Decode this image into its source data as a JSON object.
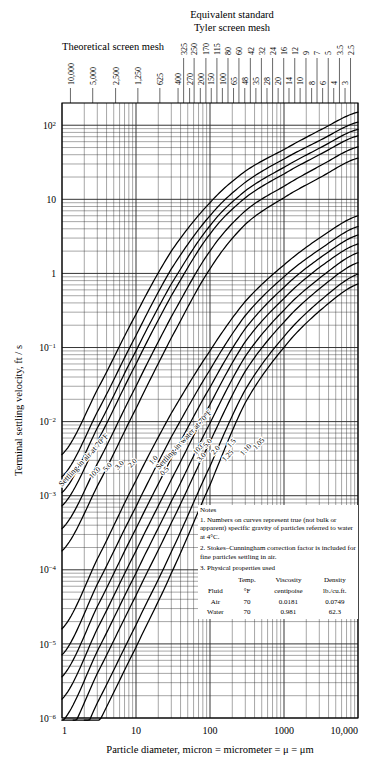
{
  "header": {
    "title_line1": "Equivalent standard",
    "title_line2": "Tyler screen mesh",
    "theoretical_label": "Theoretical screen mesh"
  },
  "axes": {
    "xlabel": "Particle diameter, micron = micrometer = μ = μm",
    "ylabel": "Terminal settling velocity, ft / s",
    "xticks": [
      "1",
      "10",
      "100",
      "1000",
      "10,000"
    ],
    "xtick_values": [
      1,
      10,
      100,
      1000,
      10000
    ],
    "yticks": [
      "10⁻⁶",
      "10⁻⁵",
      "10⁻⁴",
      "10⁻³",
      "10⁻²",
      "10⁻¹",
      "1",
      "10",
      "10²"
    ],
    "ytick_values": [
      -6,
      -5,
      -4,
      -3,
      -2,
      -1,
      0,
      1,
      2
    ],
    "xlim": [
      1,
      10000
    ],
    "ylim": [
      -6,
      2.3
    ]
  },
  "theoretical_mesh": {
    "labels": [
      "10,000",
      "5,000",
      "2,500",
      "1,250",
      "625",
      "400",
      "270",
      "200",
      "150",
      "100",
      "65",
      "48",
      "35",
      "28",
      "20",
      "14",
      "10",
      "8",
      "6",
      "4",
      "3"
    ],
    "microns": [
      1.3,
      2.6,
      5.3,
      10.6,
      21,
      37,
      53,
      74,
      104,
      147,
      208,
      295,
      417,
      589,
      833,
      1168,
      1651,
      2362,
      3327,
      4699,
      6680
    ]
  },
  "tyler_mesh": {
    "labels": [
      "325",
      "250",
      "170",
      "115",
      "80",
      "60",
      "42",
      "32",
      "24",
      "16",
      "12",
      "9",
      "7",
      "5",
      "3.5",
      "2.5"
    ],
    "microns": [
      44,
      61,
      88,
      124,
      175,
      246,
      351,
      495,
      701,
      991,
      1397,
      1981,
      2794,
      3962,
      5613,
      7925
    ]
  },
  "curve_groups": [
    {
      "name": "air",
      "annotation": "Settling in air at 70°F",
      "labels": [
        "10.0",
        "5.0",
        "3.0",
        "2.0",
        "1.0",
        "0.5"
      ],
      "sg": [
        10.0,
        5.0,
        3.0,
        2.0,
        1.0,
        0.5
      ]
    },
    {
      "name": "water",
      "annotation": "Settling in water at 70°F",
      "labels": [
        "10.0",
        "5.0",
        "3.0",
        "2.0",
        "1.5",
        "1.25",
        "1.10",
        "1.05"
      ],
      "sg": [
        10.0,
        5.0,
        3.0,
        2.0,
        1.5,
        1.25,
        1.1,
        1.05
      ]
    }
  ],
  "notes": {
    "heading": "Notes",
    "items": [
      "1.  Numbers on curves represent true (not bulk or apparent) specific gravity of particles referred to water at 4°C.",
      "2.  Stokes–Cunningham correction factor is included for fine particles settling in air.",
      "3.  Physical properties used"
    ],
    "table": {
      "headers": [
        "Fluid",
        "Temp. °F",
        "Viscosity centipoise",
        "Density lb./cu.ft."
      ],
      "header_top": [
        "",
        "Temp.",
        "Viscosity",
        "Density"
      ],
      "header_bottom": [
        "Fluid",
        "°F",
        "centipoise",
        "lb./cu.ft."
      ],
      "rows": [
        [
          "Air",
          "70",
          "0.0181",
          "0.0749"
        ],
        [
          "Water",
          "70",
          "0.981",
          "62.3"
        ]
      ]
    }
  },
  "caption": "",
  "chart_data": {
    "type": "line",
    "xlabel": "Particle diameter, micron = micrometer = μ = μm",
    "ylabel": "Terminal settling velocity, ft / s",
    "xlim": [
      1,
      10000
    ],
    "ylim": [
      1e-06,
      200
    ],
    "xscale": "log",
    "yscale": "log",
    "grid": true,
    "legend": "none (curves labeled inline)",
    "series": [
      {
        "name": "air sg 10.0",
        "group": "air",
        "sg": 10.0,
        "x": [
          1,
          3,
          10,
          30,
          100,
          300,
          1000,
          3000,
          10000
        ],
        "y": [
          0.0036,
          0.027,
          0.28,
          2.0,
          9.0,
          24.0,
          47.0,
          85.0,
          150.0
        ]
      },
      {
        "name": "air sg 5.0",
        "group": "air",
        "sg": 5.0,
        "x": [
          1,
          3,
          10,
          30,
          100,
          300,
          1000,
          3000,
          10000
        ],
        "y": [
          0.0018,
          0.0135,
          0.145,
          1.15,
          6.0,
          17.0,
          35.0,
          62.0,
          110.0
        ]
      },
      {
        "name": "air sg 3.0",
        "group": "air",
        "sg": 3.0,
        "x": [
          1,
          3,
          10,
          30,
          100,
          300,
          1000,
          3000,
          10000
        ],
        "y": [
          0.0011,
          0.0082,
          0.09,
          0.72,
          4.4,
          13.0,
          27.0,
          49.0,
          88.0
        ]
      },
      {
        "name": "air sg 2.0",
        "group": "air",
        "sg": 2.0,
        "x": [
          1,
          3,
          10,
          30,
          100,
          300,
          1000,
          3000,
          10000
        ],
        "y": [
          0.00073,
          0.0054,
          0.06,
          0.5,
          3.4,
          10.5,
          22.0,
          40.0,
          72.0
        ]
      },
      {
        "name": "air sg 1.0",
        "group": "air",
        "sg": 1.0,
        "x": [
          1,
          3,
          10,
          30,
          100,
          300,
          1000,
          3000,
          10000
        ],
        "y": [
          0.00036,
          0.0027,
          0.03,
          0.26,
          2.0,
          7.0,
          15.0,
          28.0,
          51.0
        ]
      },
      {
        "name": "air sg 0.5",
        "group": "air",
        "sg": 0.5,
        "x": [
          1,
          3,
          10,
          30,
          100,
          300,
          1000,
          3000,
          10000
        ],
        "y": [
          0.00018,
          0.00135,
          0.015,
          0.135,
          1.15,
          4.6,
          10.5,
          19.5,
          36.0
        ]
      },
      {
        "name": "water sg 10.0",
        "group": "water",
        "sg": 10.0,
        "x": [
          1,
          3,
          10,
          30,
          100,
          300,
          1000,
          3000,
          10000
        ],
        "y": [
          1.6e-05,
          0.00014,
          0.0016,
          0.013,
          0.09,
          0.42,
          1.3,
          3.0,
          6.0
        ]
      },
      {
        "name": "water sg 5.0",
        "group": "water",
        "sg": 5.0,
        "x": [
          1,
          3,
          10,
          30,
          100,
          300,
          1000,
          3000,
          10000
        ],
        "y": [
          7.1e-06,
          6.4e-05,
          0.00071,
          0.0062,
          0.05,
          0.27,
          0.9,
          2.1,
          4.3
        ]
      },
      {
        "name": "water sg 3.0",
        "group": "water",
        "sg": 3.0,
        "x": [
          1,
          3,
          10,
          30,
          100,
          300,
          1000,
          3000,
          10000
        ],
        "y": [
          3.6e-06,
          3.2e-05,
          0.00036,
          0.0032,
          0.029,
          0.18,
          0.65,
          1.6,
          3.3
        ]
      },
      {
        "name": "water sg 2.0",
        "group": "water",
        "sg": 2.0,
        "x": [
          1,
          3,
          10,
          30,
          100,
          300,
          1000,
          3000,
          10000
        ],
        "y": [
          1.8e-06,
          1.6e-05,
          0.00018,
          0.00165,
          0.017,
          0.12,
          0.46,
          1.2,
          2.5
        ]
      },
      {
        "name": "water sg 1.5",
        "group": "water",
        "sg": 1.5,
        "x": [
          1,
          3,
          10,
          30,
          100,
          300,
          1000,
          3000,
          10000
        ],
        "y": [
          8.9e-07,
          8e-06,
          9e-05,
          0.00084,
          0.0095,
          0.076,
          0.32,
          0.86,
          1.9
        ]
      },
      {
        "name": "water sg 1.25",
        "group": "water",
        "sg": 1.25,
        "x": [
          1,
          3,
          10,
          30,
          100,
          300,
          1000,
          3000,
          10000
        ],
        "y": [
          4.5e-07,
          4e-06,
          4.5e-05,
          0.00043,
          0.0053,
          0.048,
          0.22,
          0.62,
          1.4
        ]
      },
      {
        "name": "water sg 1.10",
        "group": "water",
        "sg": 1.1,
        "x": [
          1,
          3,
          10,
          30,
          100,
          300,
          1000,
          3000,
          10000
        ],
        "y": [
          1.8e-07,
          1.6e-06,
          1.8e-05,
          0.000175,
          0.0025,
          0.027,
          0.14,
          0.42,
          0.98
        ]
      },
      {
        "name": "water sg 1.05",
        "group": "water",
        "sg": 1.05,
        "x": [
          1,
          3,
          10,
          30,
          100,
          300,
          1000,
          3000,
          10000
        ],
        "y": [
          8.9e-08,
          8e-07,
          9e-06,
          9e-05,
          0.0014,
          0.018,
          0.1,
          0.31,
          0.72
        ]
      }
    ]
  }
}
